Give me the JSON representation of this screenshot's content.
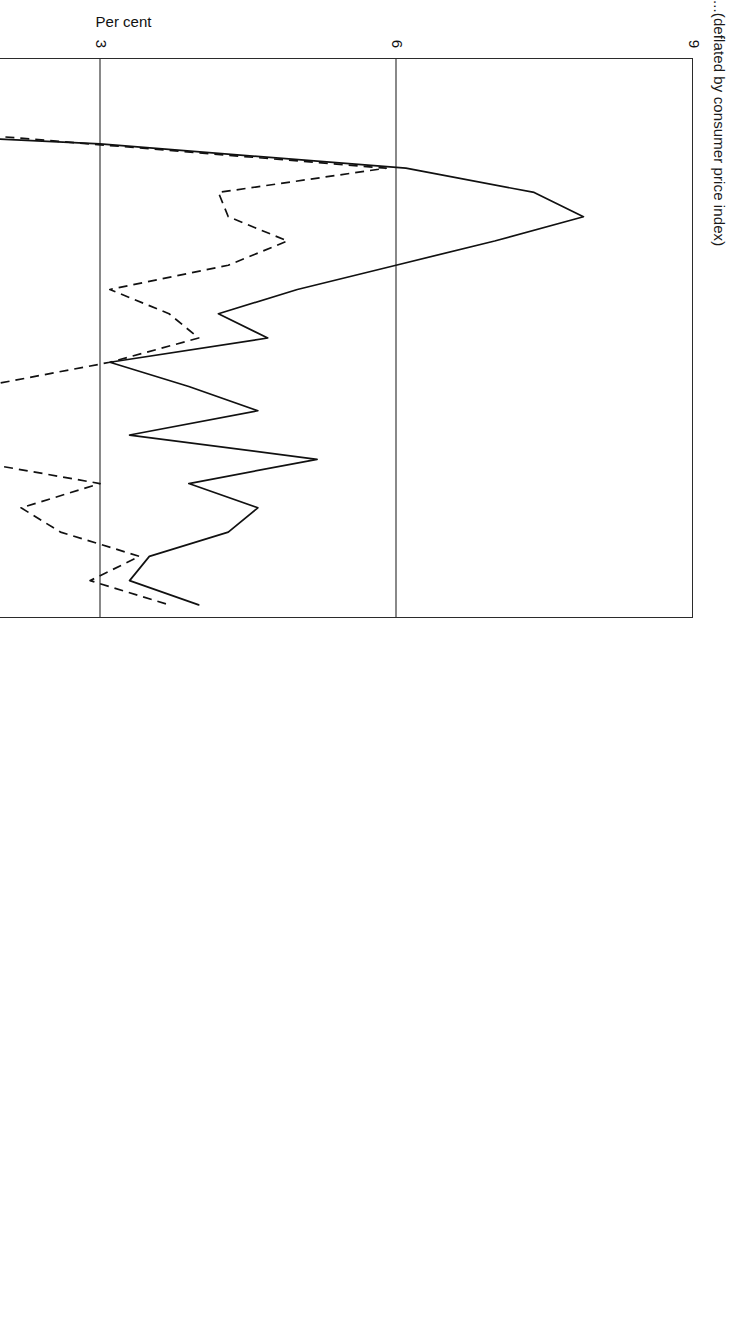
{
  "figure": {
    "title": "...(deflated by consumer price index)",
    "title_note": "title is cropped at the left edge of the page"
  },
  "axes": {
    "ylabel": "Per cent",
    "yticks": [
      "0",
      "3",
      "6",
      "9"
    ],
    "ytick_values": [
      0,
      3,
      6,
      9
    ],
    "xticks": [
      "1978",
      "1980",
      "1982",
      "1984",
      "1986",
      "1988",
      "1990",
      "1992",
      "1994",
      "1996",
      "1998",
      "2000"
    ],
    "xtick_values": [
      1978,
      1980,
      1982,
      1984,
      1986,
      1988,
      1990,
      1992,
      1994,
      1996,
      1998,
      2000
    ]
  },
  "legend": {
    "items": [
      {
        "label": "Real thirty-year Treasury rate",
        "style": "solid"
      },
      {
        "label": "Real Federal funds rate",
        "style": "dashed"
      }
    ]
  },
  "colors": {
    "line": "#111111",
    "frame": "#2b2b2b",
    "grid": "#3a3a3a",
    "background": "#ffffff"
  },
  "chart_data": {
    "type": "line",
    "title": "...(deflated by consumer price index)",
    "xlabel": "",
    "ylabel": "Per cent",
    "xlim": [
      1977.5,
      2000.5
    ],
    "ylim": [
      -3,
      9
    ],
    "grid": true,
    "grid_axis": "y",
    "gridlines": [
      0,
      3,
      6
    ],
    "legend_position": "bottom",
    "x": [
      1977.5,
      1978,
      1979,
      1980,
      1981,
      1982,
      1983,
      1984,
      1985,
      1986,
      1987,
      1988,
      1989,
      1990,
      1991,
      1992,
      1993,
      1994,
      1995,
      1996,
      1997,
      1998,
      1999,
      2000
    ],
    "series": [
      {
        "name": "Real thirty-year Treasury rate",
        "style": "solid",
        "values": [
          1.0,
          0.4,
          -1.3,
          -2.2,
          3.0,
          6.1,
          7.4,
          7.9,
          7.0,
          6.0,
          5.0,
          4.2,
          4.7,
          3.1,
          3.9,
          4.6,
          3.3,
          5.2,
          3.9,
          4.6,
          4.3,
          3.5,
          3.3,
          4.0
        ]
      },
      {
        "name": "Real Federal funds rate",
        "style": "dashed",
        "values": [
          -0.4,
          -0.6,
          -0.1,
          -0.1,
          2.9,
          5.9,
          4.2,
          4.3,
          4.9,
          4.3,
          3.1,
          3.7,
          4.0,
          3.1,
          1.8,
          0.3,
          0.0,
          1.6,
          3.0,
          2.2,
          2.6,
          3.4,
          2.9,
          3.7
        ]
      }
    ]
  }
}
